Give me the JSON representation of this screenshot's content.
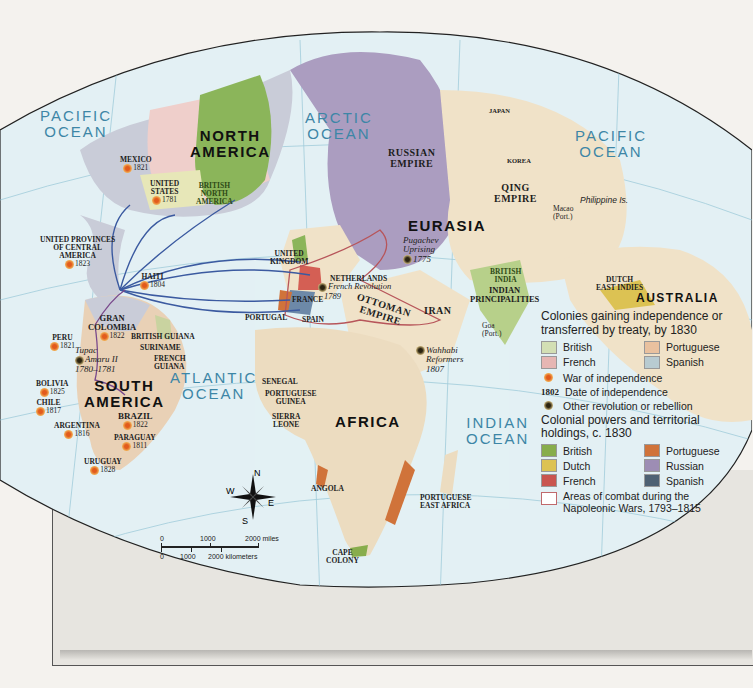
{
  "map": {
    "oceans": [
      {
        "name": "PACIFIC OCEAN",
        "line1": "PACIFIC",
        "line2": "OCEAN"
      },
      {
        "name": "ARCTIC OCEAN",
        "line1": "ARCTIC",
        "line2": "OCEAN"
      },
      {
        "name": "PACIFIC OCEAN EAST",
        "line1": "PACIFIC",
        "line2": "OCEAN"
      },
      {
        "name": "ATLANTIC OCEAN",
        "line1": "ATLANTIC",
        "line2": "OCEAN"
      },
      {
        "name": "INDIAN OCEAN",
        "line1": "INDIAN",
        "line2": "OCEAN"
      }
    ],
    "continents": {
      "north_america": {
        "line1": "NORTH",
        "line2": "AMERICA"
      },
      "south_america": {
        "line1": "SOUTH",
        "line2": "AMERICA"
      },
      "eurasia": "EURASIA",
      "africa": "AFRICA",
      "australia": "AUSTRALIA"
    },
    "independence": [
      {
        "name": "MEXICO",
        "year": "1821"
      },
      {
        "name_line1": "UNITED",
        "name_line2": "STATES",
        "year": "1781"
      },
      {
        "name_line1": "UNITED PROVINCES",
        "name_line2": "OF CENTRAL",
        "name_line3": "AMERICA",
        "year": "1823"
      },
      {
        "name": "HAITI",
        "year": "1804"
      },
      {
        "name_line1": "GRAN",
        "name_line2": "COLOMBIA",
        "year": "1822"
      },
      {
        "name": "PERU",
        "year": "1821"
      },
      {
        "name": "BOLIVIA",
        "year": "1825"
      },
      {
        "name": "CHILE",
        "year": "1817"
      },
      {
        "name": "ARGENTINA",
        "year": "1816"
      },
      {
        "name": "BRAZIL",
        "year": "1822"
      },
      {
        "name": "PARAGUAY",
        "year": "1811"
      },
      {
        "name": "URUGUAY",
        "year": "1828"
      }
    ],
    "rebellions": [
      {
        "line1": "Tupac",
        "line2": "Amaru II",
        "line3": "1780–1781"
      },
      {
        "line1": "Pugachev",
        "line2": "Uprising",
        "line3": "1775"
      },
      {
        "line1": "French Revolution",
        "line2": "1789"
      },
      {
        "line1": "Wahhabi",
        "line2": "Reformers",
        "line3": "1807"
      }
    ],
    "places": {
      "british_north_america": {
        "line1": "BRITISH",
        "line2": "NORTH",
        "line3": "AMERICA"
      },
      "united_kingdom": {
        "line1": "UNITED",
        "line2": "KINGDOM"
      },
      "netherlands": "NETHERLANDS",
      "france": "FRANCE",
      "portugal": "PORTUGAL",
      "spain": "SPAIN",
      "russian_empire": {
        "line1": "RUSSIAN",
        "line2": "EMPIRE"
      },
      "ottoman_empire": {
        "line1": "OTTOMAN",
        "line2": "EMPIRE"
      },
      "iran": "IRAN",
      "qing_empire": {
        "line1": "QING",
        "line2": "EMPIRE"
      },
      "japan": "JAPAN",
      "korea": "KOREA",
      "macao": {
        "line1": "Macao",
        "line2": "(Port.)"
      },
      "philippine": "Philippine Is.",
      "british_india": {
        "line1": "BRITISH",
        "line2": "INDIA"
      },
      "indian_principalities": {
        "line1": "INDIAN",
        "line2": "PRINCIPALITIES"
      },
      "goa": {
        "line1": "Goa",
        "line2": "(Port.)"
      },
      "dutch_east_indies": {
        "line1": "DUTCH",
        "line2": "EAST INDIES"
      },
      "british_guiana": "BRITISH GUIANA",
      "suriname": "SURINAME",
      "french_guiana": {
        "line1": "FRENCH",
        "line2": "GUIANA"
      },
      "senegal": "SENEGAL",
      "portuguese_guinea": {
        "line1": "PORTUGUESE",
        "line2": "GUINEA"
      },
      "sierra_leone": {
        "line1": "SIERRA",
        "line2": "LEONE"
      },
      "angola": "ANGOLA",
      "portuguese_east_africa": {
        "line1": "PORTUGUESE",
        "line2": "EAST AFRICA"
      },
      "cape_colony": {
        "line1": "CAPE",
        "line2": "COLONY"
      }
    },
    "compass": {
      "n": "N",
      "s": "S",
      "e": "E",
      "w": "W"
    },
    "scale": {
      "miles": [
        "0",
        "1000",
        "2000 miles"
      ],
      "km": [
        "0",
        "1000",
        "2000 kilometers"
      ]
    }
  },
  "legend": {
    "section1_title": "Colonies gaining independence or transferred by treaty, by 1830",
    "section1_items": [
      {
        "label": "British",
        "color": "#d3dfb4"
      },
      {
        "label": "Portuguese",
        "color": "#e9c19f"
      },
      {
        "label": "French",
        "color": "#e6b6b3"
      },
      {
        "label": "Spanish",
        "color": "#b8cbd1"
      }
    ],
    "war_of_independence": "War of independence",
    "date_sample": "1802",
    "date_of_independence": "Date of independence",
    "other_revolution": "Other revolution or rebellion",
    "section2_title": "Colonial powers and territorial holdings, c. 1830",
    "section2_items": [
      {
        "label": "British",
        "color": "#88ad4c"
      },
      {
        "label": "Portuguese",
        "color": "#d0733a"
      },
      {
        "label": "Dutch",
        "color": "#dcc253"
      },
      {
        "label": "Russian",
        "color": "#9d8db4"
      },
      {
        "label": "French",
        "color": "#c9554f"
      },
      {
        "label": "Spanish",
        "color": "#4f6173"
      }
    ],
    "combat_areas": "Areas of combat during the Napoleonic Wars, 1793–1815"
  }
}
